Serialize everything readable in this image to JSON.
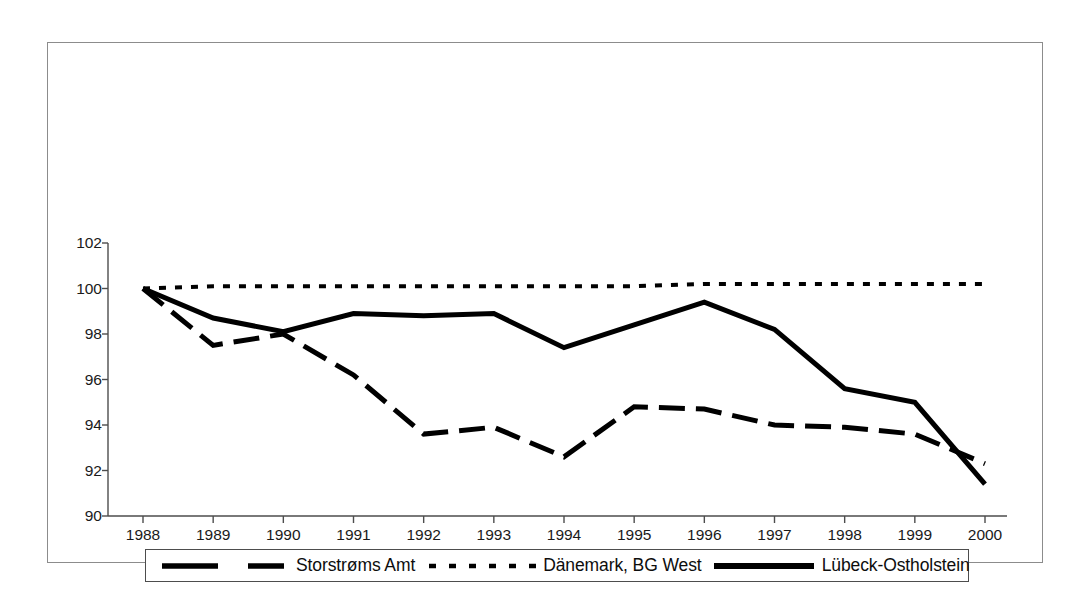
{
  "chart_data": {
    "type": "line",
    "title": "",
    "subtitle": "",
    "xlabel": "",
    "ylabel": "",
    "x": [
      1988,
      1989,
      1990,
      1991,
      1992,
      1993,
      1994,
      1995,
      1996,
      1997,
      1998,
      1999,
      2000
    ],
    "categories": [
      "1988",
      "1989",
      "1990",
      "1991",
      "1992",
      "1993",
      "1994",
      "1995",
      "1996",
      "1997",
      "1998",
      "1999",
      "2000"
    ],
    "xlim": [
      1988,
      2000
    ],
    "ylim": [
      90,
      102
    ],
    "yticks": [
      90,
      92,
      94,
      96,
      98,
      100,
      102
    ],
    "ytick_labels": [
      "90",
      "92",
      "94",
      "96",
      "98",
      "100",
      "102"
    ],
    "grid": false,
    "legend_position": "bottom",
    "series": [
      {
        "name": "Storstrøms Amt",
        "style": "dashed",
        "color": "#000000",
        "values": [
          100.0,
          97.5,
          98.0,
          96.2,
          93.6,
          93.9,
          92.6,
          94.8,
          94.7,
          94.0,
          93.9,
          93.6,
          92.3
        ]
      },
      {
        "name": "Dänemark, BG West",
        "style": "dotted",
        "color": "#000000",
        "values": [
          100.0,
          100.1,
          100.1,
          100.1,
          100.1,
          100.1,
          100.1,
          100.1,
          100.2,
          100.2,
          100.2,
          100.2,
          100.2
        ]
      },
      {
        "name": "Lübeck-Ostholstein",
        "style": "solid",
        "color": "#000000",
        "values": [
          100.0,
          98.7,
          98.1,
          98.9,
          98.8,
          98.9,
          97.4,
          98.4,
          99.4,
          98.2,
          95.6,
          95.0,
          91.4
        ]
      }
    ]
  },
  "legend": {
    "entries": [
      {
        "label": "Storstrøms Amt",
        "style": "dashed"
      },
      {
        "label": "Dänemark, BG West",
        "style": "dotted"
      },
      {
        "label": "Lübeck-Ostholstein",
        "style": "solid"
      }
    ]
  },
  "axes": {
    "y_ticks": [
      "102",
      "100",
      "98",
      "96",
      "94",
      "92",
      "90"
    ],
    "x_ticks": [
      "1988",
      "1989",
      "1990",
      "1991",
      "1992",
      "1993",
      "1994",
      "1995",
      "1996",
      "1997",
      "1998",
      "1999",
      "2000"
    ]
  },
  "colors": {
    "line": "#000000",
    "axis": "#4d4d4d",
    "frame": "#8c8c8c",
    "text": "#1a1a1a",
    "background": "#ffffff"
  }
}
